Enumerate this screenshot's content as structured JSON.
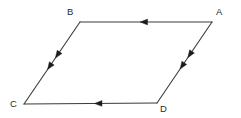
{
  "figure": {
    "name": "parallelogram-abcd",
    "type": "geometry-diagram",
    "background_color": "#ffffff",
    "stroke_color": "#3a3a3a",
    "arrow_color": "#1d1d1d",
    "stroke_width": 1.1,
    "width": 241,
    "height": 118
  },
  "vertices": [
    {
      "id": "A",
      "label": "A",
      "x": 212,
      "y": 22,
      "label_x": 216,
      "label_y": 7
    },
    {
      "id": "B",
      "label": "B",
      "x": 80,
      "y": 22,
      "label_x": 67,
      "label_y": 7
    },
    {
      "id": "C",
      "label": "C",
      "x": 24,
      "y": 104,
      "label_x": 10,
      "label_y": 99
    },
    {
      "id": "D",
      "label": "D",
      "x": 157,
      "y": 103,
      "label_x": 160,
      "label_y": 104
    }
  ],
  "edges": [
    {
      "id": "AB",
      "name": "edge-a-to-b",
      "from": "A",
      "to": "B",
      "x1": 212,
      "y1": 22,
      "x2": 80,
      "y2": 22,
      "direction": "left",
      "arrow_count": 1,
      "arrow_positions": [
        0.545
      ]
    },
    {
      "id": "BC",
      "name": "edge-b-to-c",
      "from": "B",
      "to": "C",
      "x1": 80,
      "y1": 22,
      "x2": 24,
      "y2": 104,
      "direction": "down-left",
      "arrow_count": 2,
      "arrow_positions": [
        0.44,
        0.58
      ]
    },
    {
      "id": "DC",
      "name": "edge-d-to-c",
      "from": "D",
      "to": "C",
      "x1": 157,
      "y1": 103,
      "x2": 24,
      "y2": 104,
      "direction": "left",
      "arrow_count": 1,
      "arrow_positions": [
        0.47
      ]
    },
    {
      "id": "AD",
      "name": "edge-a-to-d",
      "from": "A",
      "to": "D",
      "x1": 212,
      "y1": 22,
      "x2": 157,
      "y2": 103,
      "direction": "down-left",
      "arrow_count": 2,
      "arrow_positions": [
        0.44,
        0.58
      ]
    }
  ],
  "arrow_style": {
    "length": 7.5,
    "half_width": 2.9
  }
}
